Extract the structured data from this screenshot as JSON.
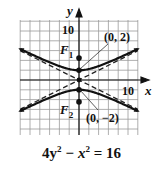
{
  "chart_data": {
    "type": "line",
    "title": "",
    "equation": "4y² − x² = 16",
    "curve": "hyperbola",
    "xlabel": "x",
    "ylabel": "y",
    "xlim": [
      -12,
      12
    ],
    "ylim": [
      -11,
      12
    ],
    "grid": true,
    "grid_step": 2,
    "tick_labels": {
      "x": [
        "10"
      ],
      "y": [
        "10"
      ]
    },
    "series": [
      {
        "name": "hyperbola upper branch",
        "style": "solid",
        "equation": "y = sqrt(4 + x^2/4)"
      },
      {
        "name": "hyperbola lower branch",
        "style": "solid",
        "equation": "y = -sqrt(4 + x^2/4)"
      },
      {
        "name": "asymptote",
        "style": "dashed",
        "equation": "y = x/2"
      },
      {
        "name": "asymptote",
        "style": "dashed",
        "equation": "y = -x/2"
      }
    ],
    "points": [
      {
        "label": "F1",
        "x": 0,
        "y": 4.47
      },
      {
        "label": "(0, 2)",
        "x": 0,
        "y": 2
      },
      {
        "label": "(0, −2)",
        "x": 0,
        "y": -2
      },
      {
        "label": "F2",
        "x": 0,
        "y": -4.47
      }
    ],
    "annotations": [
      "(0, 2)",
      "(0, −2)",
      "F1",
      "F2"
    ]
  },
  "labels": {
    "y_axis": "y",
    "x_axis": "x",
    "y_tick": "10",
    "x_tick": "10",
    "vertex_top": "(0, 2)",
    "vertex_bottom": "(0, −2)",
    "focus_top_letter": "F",
    "focus_top_sub": "1",
    "focus_bottom_letter": "F",
    "focus_bottom_sub": "2"
  },
  "equation_parts": {
    "a": "4y",
    "b": "2",
    "c": " − x",
    "d": "2",
    "e": " = 16"
  }
}
